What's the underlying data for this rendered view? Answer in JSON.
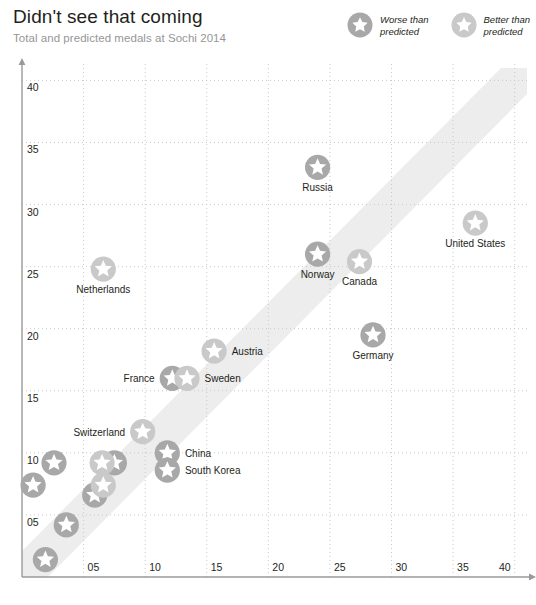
{
  "header": {
    "title": "Didn't see that coming",
    "subtitle": "Total and predicted medals at Sochi 2014"
  },
  "legend": {
    "items": [
      {
        "label": "Worse than\npredicted",
        "color": "#a8a8a8",
        "icon": "star-badge-icon"
      },
      {
        "label": "Better than\npredicted",
        "color": "#c9c9c9",
        "icon": "star-badge-icon"
      }
    ]
  },
  "colors": {
    "worse": "#a8a8a8",
    "better": "#c9c9c9",
    "grid": "#c9c9c9",
    "axis": "#9a9a9a",
    "band": "#ededed",
    "text": "#231f20",
    "subtitle": "#969696"
  },
  "chart_data": {
    "type": "scatter",
    "title": "Didn't see that coming",
    "subtitle": "Total and predicted medals at Sochi 2014",
    "xlabel": "Predicted medals",
    "ylabel": "Total medals",
    "xlim": [
      0,
      41
    ],
    "ylim": [
      0,
      41
    ],
    "xticks": [
      "05",
      "10",
      "15",
      "20",
      "25",
      "30",
      "35",
      "40"
    ],
    "xtickvalues": [
      5,
      10,
      15,
      20,
      25,
      30,
      35,
      40
    ],
    "yticks": [
      "05",
      "10",
      "15",
      "20",
      "25",
      "30",
      "35",
      "40"
    ],
    "ytickvalues": [
      5,
      10,
      15,
      20,
      25,
      30,
      35,
      40
    ],
    "grid": true,
    "legend_position": "top-right",
    "reference_band": {
      "description": "diagonal y = x parity band",
      "color": "#ededed"
    },
    "series": [
      {
        "name": "Worse than predicted",
        "color": "#a8a8a8",
        "points": [
          {
            "label": "Russia",
            "x": 24.0,
            "y": 33.0,
            "label_pos": "below"
          },
          {
            "label": "Norway",
            "x": 24.0,
            "y": 26.0,
            "label_pos": "below"
          },
          {
            "label": "Germany",
            "x": 28.5,
            "y": 19.5,
            "label_pos": "below"
          },
          {
            "label": "France",
            "x": 12.2,
            "y": 16.0,
            "label_pos": "left"
          },
          {
            "label": "China",
            "x": 11.8,
            "y": 10.0,
            "label_pos": "right"
          },
          {
            "label": "South Korea",
            "x": 11.8,
            "y": 8.6,
            "label_pos": "right"
          },
          {
            "label": "",
            "x": 2.6,
            "y": 9.2,
            "label_pos": "none"
          },
          {
            "label": "",
            "x": 7.5,
            "y": 9.2,
            "label_pos": "none"
          },
          {
            "label": "",
            "x": 0.9,
            "y": 7.4,
            "label_pos": "none"
          },
          {
            "label": "",
            "x": 5.9,
            "y": 6.6,
            "label_pos": "none"
          },
          {
            "label": "",
            "x": 3.6,
            "y": 4.2,
            "label_pos": "none"
          },
          {
            "label": "",
            "x": 1.9,
            "y": 1.4,
            "label_pos": "none"
          }
        ]
      },
      {
        "name": "Better than predicted",
        "color": "#c9c9c9",
        "points": [
          {
            "label": "United States",
            "x": 36.8,
            "y": 28.5,
            "label_pos": "below"
          },
          {
            "label": "Canada",
            "x": 27.4,
            "y": 25.4,
            "label_pos": "below"
          },
          {
            "label": "Netherlands",
            "x": 6.6,
            "y": 24.8,
            "label_pos": "below"
          },
          {
            "label": "Austria",
            "x": 15.6,
            "y": 18.2,
            "label_pos": "right"
          },
          {
            "label": "Sweden",
            "x": 13.4,
            "y": 16.0,
            "label_pos": "right"
          },
          {
            "label": "Switzerland",
            "x": 9.8,
            "y": 11.7,
            "label_pos": "left"
          },
          {
            "label": "",
            "x": 6.5,
            "y": 9.2,
            "label_pos": "none"
          },
          {
            "label": "",
            "x": 6.6,
            "y": 7.4,
            "label_pos": "none"
          }
        ]
      }
    ]
  }
}
